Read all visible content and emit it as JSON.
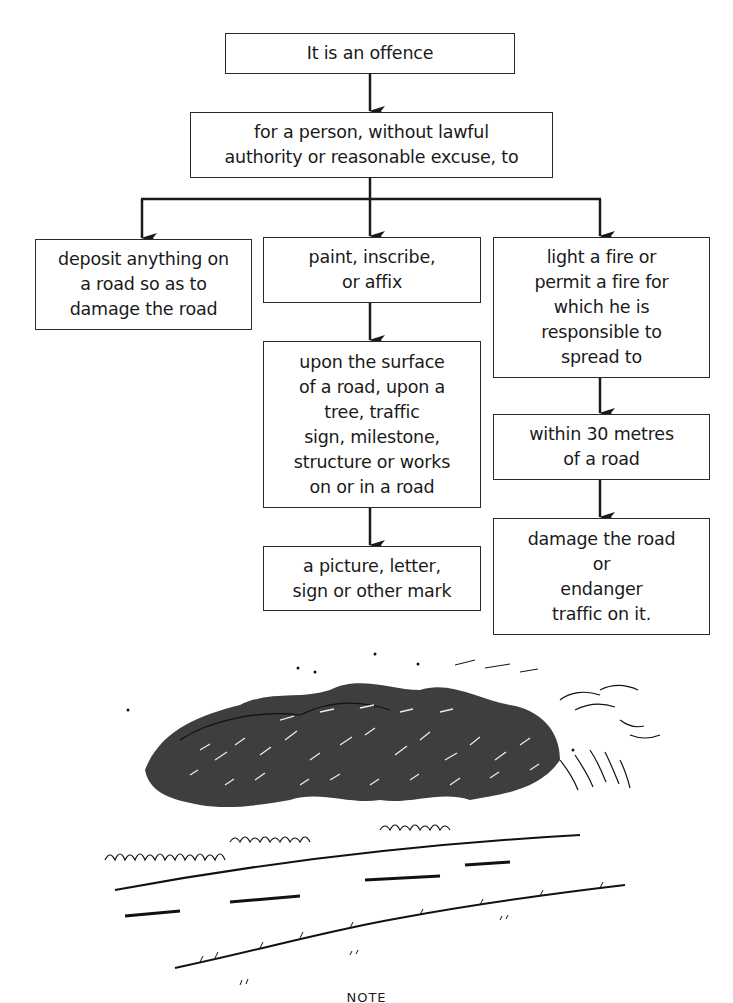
{
  "diagram": {
    "type": "flowchart",
    "nodes": [
      {
        "id": "root",
        "text": "It is an offence"
      },
      {
        "id": "condition",
        "text": "for a person, without lawful\nauthority or reasonable excuse, to"
      },
      {
        "id": "deposit",
        "text": "deposit anything on\na road so as to\ndamage the road"
      },
      {
        "id": "paint",
        "text": "paint, inscribe,\nor affix"
      },
      {
        "id": "upon",
        "text": "upon the surface\nof a road, upon a\ntree, traffic\nsign, milestone,\nstructure or works\non or in a road"
      },
      {
        "id": "mark",
        "text": "a picture, letter,\nsign or other mark"
      },
      {
        "id": "fire",
        "text": "light a fire or\npermit a fire for\nwhich he is\nresponsible to\nspread to"
      },
      {
        "id": "within",
        "text": "within 30 metres\nof a road"
      },
      {
        "id": "damage",
        "text": "damage the road\nor\nendanger\ntraffic on it."
      }
    ],
    "edges": [
      [
        "root",
        "condition"
      ],
      [
        "condition",
        "deposit"
      ],
      [
        "condition",
        "paint"
      ],
      [
        "condition",
        "fire"
      ],
      [
        "paint",
        "upon"
      ],
      [
        "upon",
        "mark"
      ],
      [
        "fire",
        "within"
      ],
      [
        "within",
        "damage"
      ]
    ]
  },
  "illustration": {
    "subject": "roadside-hedge-and-road-sketch"
  },
  "footer": {
    "note_label": "NOTE"
  }
}
